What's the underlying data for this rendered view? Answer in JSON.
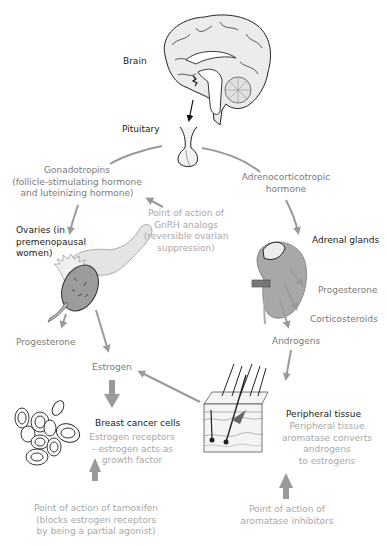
{
  "diagram": {
    "colors": {
      "primary_text": "#1a1a1a",
      "pathway_text": "#7a7a7a",
      "drug_action_text": "#a8a8a8",
      "arrow": "#9a9a9a",
      "organ_fill": "#d9d9d9"
    },
    "nodes": {
      "brain": {
        "label": "Brain",
        "icon": "brain-icon"
      },
      "pituitary": {
        "label": "Pituitary",
        "icon": "pituitary-icon"
      },
      "gonadotropins": {
        "line1": "Gonadotropins",
        "line2": "(follicle-stimulating hormone",
        "line3": "and luteinizing hormone)"
      },
      "acth": {
        "line1": "Adrenocorticotropic",
        "line2": "hormone"
      },
      "gnrh_action": {
        "line1": "Point of action of",
        "line2": "GnRH analogs",
        "line3": "(reversible ovarian",
        "line4": "suppression)"
      },
      "ovaries": {
        "line1": "Ovaries (in",
        "line2": "premenopausal",
        "line3": "women)",
        "icon": "ovary-icon"
      },
      "ovary_progesterone": {
        "label": "Progesterone"
      },
      "adrenal": {
        "label": "Adrenal glands",
        "icon": "adrenal-gland-icon"
      },
      "adrenal_progesterone": {
        "label": "Progesterone"
      },
      "corticosteroids": {
        "label": "Corticosteroids"
      },
      "androgens": {
        "label": "Androgens"
      },
      "estrogen": {
        "label": "Estrogen"
      },
      "breast_cancer": {
        "label": "Breast cancer cells",
        "line1": "Estrogen receptors",
        "line2": "– estrogen acts as",
        "line3": "growth factor",
        "icon": "cancer-cells-icon"
      },
      "peripheral": {
        "label": "Peripheral tissue",
        "line1": "Peripheral tissue",
        "line2": "aromatase converts",
        "line3": "androgens",
        "line4": "to estrogens",
        "icon": "skin-tissue-icon"
      },
      "tamoxifen_action": {
        "line1": "Point of action of tamoxifen",
        "line2": "(blocks estrogen receptors",
        "line3": "by being a partial agonist)"
      },
      "aromatase_action": {
        "line1": "Point of action of",
        "line2": "aromatase inhibitors"
      }
    }
  }
}
